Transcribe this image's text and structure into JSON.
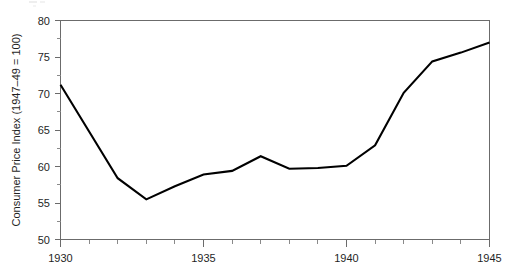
{
  "chart_data": {
    "type": "line",
    "title": "",
    "xlabel": "",
    "ylabel": "Consumer Price Index (1947–49 = 100)",
    "x": [
      1930,
      1931,
      1932,
      1933,
      1934,
      1935,
      1936,
      1937,
      1938,
      1939,
      1940,
      1941,
      1942,
      1943,
      1944,
      1945
    ],
    "values": [
      71.2,
      64.8,
      58.4,
      55.5,
      57.3,
      58.9,
      59.4,
      61.4,
      59.7,
      59.8,
      60.1,
      62.9,
      70.1,
      74.4,
      75.6,
      77.0
    ],
    "series": [
      {
        "name": "Consumer Price Index",
        "values": [
          71.2,
          64.8,
          58.4,
          55.5,
          57.3,
          58.9,
          59.4,
          61.4,
          59.7,
          59.8,
          60.1,
          62.9,
          70.1,
          74.4,
          75.6,
          77.0
        ]
      }
    ],
    "xlim": [
      1930,
      1945
    ],
    "ylim": [
      50,
      80
    ],
    "x_ticks_major": [
      1930,
      1935,
      1940,
      1945
    ],
    "x_tick_labels": [
      "1930",
      "1935",
      "1940",
      "1945"
    ],
    "x_ticks_minor": [
      1931,
      1932,
      1933,
      1934,
      1936,
      1937,
      1938,
      1939,
      1941,
      1942,
      1943,
      1944
    ],
    "y_ticks_major": [
      50,
      55,
      60,
      65,
      70,
      75,
      80
    ],
    "y_tick_labels": [
      "50",
      "55",
      "60",
      "65",
      "70",
      "75",
      "80"
    ],
    "y_ticks_minor": [
      52.5,
      57.5,
      62.5,
      67.5,
      72.5,
      77.5
    ],
    "grid": false,
    "legend": null,
    "line_color": "#000000",
    "axis_color": "#6b6b6b"
  },
  "axis": {
    "y_title": "Consumer Price Index (1947–49 = 100)",
    "y_labels": {
      "t50": "50",
      "t55": "55",
      "t60": "60",
      "t65": "65",
      "t70": "70",
      "t75": "75",
      "t80": "80"
    },
    "x_labels": {
      "t1930": "1930",
      "t1935": "1935",
      "t1940": "1940",
      "t1945": "1945"
    }
  }
}
